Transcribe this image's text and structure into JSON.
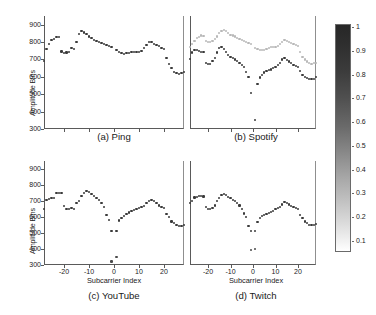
{
  "figure": {
    "ylabel": "Amplitude Bins",
    "xlabel": "Subcarrier Index",
    "yticks": [
      "900",
      "800",
      "700",
      "600",
      "500",
      "400",
      "300"
    ],
    "xticks": [
      "-20",
      "-10",
      "0",
      "10",
      "20"
    ]
  },
  "colorbar": {
    "name": "grayscale-colorbar",
    "ticks": [
      "1",
      "0.9",
      "0.8",
      "0.7",
      "0.6",
      "0.5",
      "0.4",
      "0.3",
      "0.2",
      "0.1"
    ],
    "min": 0.1,
    "max": 1,
    "high_color": "#272727",
    "low_color": "#ffffff"
  },
  "panels": [
    {
      "caption": "(a) Ping",
      "key": "ping"
    },
    {
      "caption": "(b) Spotify",
      "key": "spotify"
    },
    {
      "caption": "(c) YouTube",
      "key": "youtube"
    },
    {
      "caption": "(d) Twitch",
      "key": "twitch"
    }
  ],
  "chart_data": {
    "type": "scatter",
    "title": "",
    "xlabel": "Subcarrier Index",
    "ylabel": "Amplitude Bins",
    "xlim": [
      -28,
      28
    ],
    "ylim": [
      300,
      950
    ],
    "xticks": [
      -20,
      -10,
      0,
      10,
      20
    ],
    "yticks": [
      300,
      400,
      500,
      600,
      700,
      800,
      900
    ],
    "grid": false,
    "legend": "none",
    "colorbar": {
      "label": "",
      "min": 0.1,
      "max": 1,
      "cmap": "gray-reversed"
    },
    "subplots": [
      {
        "name": "(a) Ping",
        "x": [
          -28,
          -27,
          -26,
          -25,
          -24,
          -23,
          -22,
          -21,
          -20,
          -19,
          -18,
          -17,
          -16,
          -15,
          -14,
          -13,
          -12,
          -11,
          -10,
          -9,
          -8,
          -7,
          -6,
          -5,
          -4,
          -3,
          -2,
          -1,
          1,
          2,
          3,
          4,
          5,
          6,
          7,
          8,
          9,
          10,
          11,
          12,
          13,
          14,
          15,
          16,
          17,
          18,
          19,
          20,
          21,
          22,
          23,
          24,
          25,
          26,
          27,
          28
        ],
        "series": [
          {
            "name": "amplitude",
            "color": "#3a3a3a",
            "values": [
              693,
              760,
              790,
              810,
              818,
              830,
              828,
              746,
              736,
              740,
              742,
              765,
              762,
              800,
              845,
              862,
              855,
              845,
              832,
              822,
              812,
              805,
              800,
              793,
              788,
              784,
              780,
              772,
              752,
              742,
              735,
              733,
              735,
              738,
              742,
              744,
              744,
              742,
              748,
              765,
              782,
              800,
              798,
              790,
              783,
              775,
              768,
              762,
              708,
              672,
              652,
              630,
              622,
              618,
              622,
              628
            ]
          }
        ]
      },
      {
        "name": "(b) Spotify",
        "x": [
          -28,
          -27,
          -26,
          -25,
          -24,
          -23,
          -22,
          -21,
          -20,
          -19,
          -18,
          -17,
          -16,
          -15,
          -14,
          -13,
          -12,
          -11,
          -10,
          -9,
          -8,
          -7,
          -6,
          -5,
          -4,
          -3,
          -2,
          -1,
          1,
          2,
          3,
          4,
          5,
          6,
          7,
          8,
          9,
          10,
          11,
          12,
          13,
          14,
          15,
          16,
          17,
          18,
          19,
          20,
          21,
          22,
          23,
          24,
          25,
          26,
          27,
          28
        ],
        "series": [
          {
            "name": "upper-trace",
            "color": "#b8b8b8",
            "values": [
              772,
              790,
              808,
              822,
              830,
              838,
              836,
              808,
              800,
              802,
              805,
              820,
              832,
              850,
              862,
              868,
              862,
              852,
              842,
              838,
              832,
              826,
              820,
              812,
              805,
              800,
              795,
              788,
              768,
              760,
              755,
              752,
              756,
              760,
              766,
              770,
              772,
              774,
              780,
              790,
              800,
              812,
              808,
              800,
              795,
              788,
              782,
              775,
              742,
              716,
              700,
              688,
              680,
              676,
              678,
              682
            ]
          },
          {
            "name": "lower-trace",
            "color": "#3a3a3a",
            "values": [
              705,
              740,
              756,
              752,
              748,
              745,
              742,
              678,
              672,
              676,
              690,
              706,
              740,
              765,
              772,
              760,
              742,
              728,
              716,
              706,
              700,
              690,
              682,
              670,
              655,
              630,
              600,
              505,
              352,
              560,
              596,
              612,
              625,
              632,
              638,
              642,
              650,
              658,
              668,
              682,
              700,
              706,
              698,
              688,
              678,
              670,
              664,
              658,
              632,
              610,
              600,
              592,
              588,
              585,
              590,
              600
            ]
          }
        ]
      },
      {
        "name": "(c) YouTube",
        "x": [
          -28,
          -27,
          -26,
          -25,
          -24,
          -23,
          -22,
          -21,
          -20,
          -19,
          -18,
          -17,
          -16,
          -15,
          -14,
          -13,
          -12,
          -11,
          -10,
          -9,
          -8,
          -7,
          -6,
          -5,
          -4,
          -3,
          -2,
          -1,
          1,
          2,
          3,
          4,
          5,
          6,
          7,
          8,
          9,
          10,
          11,
          12,
          13,
          14,
          15,
          16,
          17,
          18,
          19,
          20,
          21,
          22,
          23,
          24,
          25,
          26,
          27,
          28
        ],
        "series": [
          {
            "name": "amplitude",
            "color": "#3a3a3a",
            "values": [
              648,
              706,
              712,
              716,
              720,
              748,
              752,
              750,
              668,
              652,
              648,
              656,
              650,
              690,
              700,
              730,
              752,
              760,
              756,
              742,
              732,
              720,
              706,
              686,
              660,
              610,
              580,
              510,
              512,
              578,
              596,
              608,
              618,
              628,
              638,
              642,
              648,
              655,
              662,
              670,
              685,
              700,
              706,
              700,
              688,
              672,
              662,
              655,
              618,
              598,
              572,
              562,
              548,
              542,
              546,
              552
            ]
          },
          {
            "name": "isolated-low",
            "color": "#4a4a4a",
            "values_x": [
              -1,
              1
            ],
            "values_y": [
              322,
              352
            ]
          }
        ]
      },
      {
        "name": "(d) Twitch",
        "x": [
          -28,
          -27,
          -26,
          -25,
          -24,
          -23,
          -22,
          -21,
          -20,
          -19,
          -18,
          -17,
          -16,
          -15,
          -14,
          -13,
          -12,
          -11,
          -10,
          -9,
          -8,
          -7,
          -6,
          -5,
          -4,
          -3,
          -2,
          -1,
          1,
          2,
          3,
          4,
          5,
          6,
          7,
          8,
          9,
          10,
          11,
          12,
          13,
          14,
          15,
          16,
          17,
          18,
          19,
          20,
          21,
          22,
          23,
          24,
          25,
          26,
          27,
          28
        ],
        "series": [
          {
            "name": "amplitude",
            "color": "#3a3a3a",
            "values": [
              690,
              700,
              722,
              726,
              730,
              732,
              728,
              660,
              652,
              650,
              656,
              672,
              700,
              718,
              736,
              742,
              738,
              726,
              716,
              708,
              700,
              688,
              672,
              650,
              622,
              600,
              545,
              512,
              510,
              570,
              596,
              605,
              612,
              618,
              626,
              632,
              640,
              648,
              655,
              665,
              678,
              692,
              688,
              678,
              670,
              662,
              655,
              648,
              612,
              596,
              572,
              562,
              552,
              548,
              552,
              556
            ]
          },
          {
            "name": "isolated-low",
            "color": "#4a4a4a",
            "values_x": [
              -1,
              1
            ],
            "values_y": [
              392,
              402
            ]
          }
        ]
      }
    ]
  }
}
